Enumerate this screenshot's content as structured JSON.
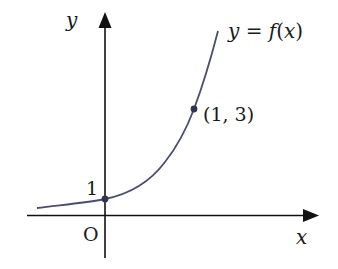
{
  "diagram": {
    "type": "function-graph",
    "axes": {
      "x_label": "x",
      "y_label": "y",
      "origin_label": "O"
    },
    "curve": {
      "label": "y = f(x)",
      "label_parts": [
        "y",
        " = ",
        "f",
        "(",
        "x",
        ")"
      ],
      "color": "#4a4e6e"
    },
    "points": [
      {
        "label": "1",
        "x": 0,
        "y": 1,
        "display": "1"
      },
      {
        "label": "(1, 3)",
        "x": 1,
        "y": 3,
        "display": "(1, 3)"
      }
    ],
    "colors": {
      "axis": "#111111",
      "curve": "#4a4e6e",
      "point": "#2f3552"
    }
  }
}
